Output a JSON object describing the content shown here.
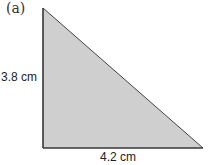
{
  "figure": {
    "label": "(a)",
    "shape": "right-triangle",
    "height_label": "3.8 cm",
    "base_label": "4.2 cm",
    "fill_color": "#cfcfcf",
    "stroke_color": "#333333"
  }
}
